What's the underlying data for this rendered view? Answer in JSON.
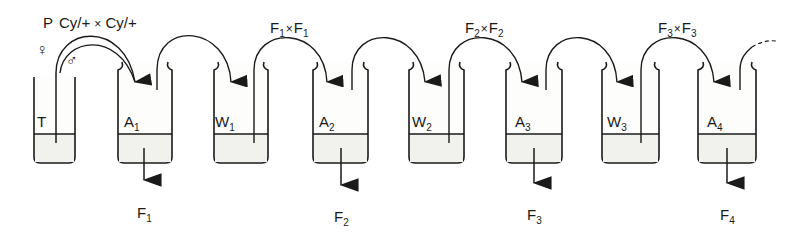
{
  "diagram": {
    "title_cross": {
      "generation": "P",
      "parent1": "Cy/+",
      "cross_symbol": "×",
      "parent2": "Cy/+"
    },
    "sex_symbols": {
      "female": "♀",
      "male": "♂"
    },
    "crosses": [
      {
        "label_a": "F",
        "sub_a": "1",
        "x": "×",
        "label_b": "F",
        "sub_b": "1"
      },
      {
        "label_a": "F",
        "sub_a": "2",
        "x": "×",
        "label_b": "F",
        "sub_b": "2"
      },
      {
        "label_a": "F",
        "sub_a": "3",
        "x": "×",
        "label_b": "F",
        "sub_b": "3"
      }
    ],
    "tubes": [
      {
        "id": "T",
        "label": "T",
        "sub": ""
      },
      {
        "id": "A1",
        "label": "A",
        "sub": "1"
      },
      {
        "id": "W1",
        "label": "W",
        "sub": "1"
      },
      {
        "id": "A2",
        "label": "A",
        "sub": "2"
      },
      {
        "id": "W2",
        "label": "W",
        "sub": "2"
      },
      {
        "id": "A3",
        "label": "A",
        "sub": "3"
      },
      {
        "id": "W3",
        "label": "W",
        "sub": "3"
      },
      {
        "id": "A4",
        "label": "A",
        "sub": "4"
      }
    ],
    "outputs": [
      {
        "label": "F",
        "sub": "1"
      },
      {
        "label": "F",
        "sub": "2"
      },
      {
        "label": "F",
        "sub": "3"
      },
      {
        "label": "F",
        "sub": "4"
      }
    ],
    "colors": {
      "ink": "#1a1a1a",
      "background": "#ffffff",
      "liquid": "#f1f1ee"
    }
  }
}
